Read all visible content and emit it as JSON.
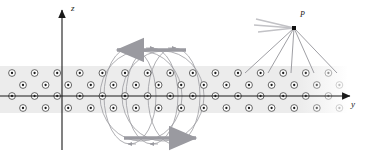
{
  "figure": {
    "background_color": "#ffffff",
    "width": 365,
    "height": 161
  },
  "axes": {
    "vertical": {
      "name": "z-axis",
      "label": "z",
      "direction": "up",
      "x": 62,
      "y_top": 10,
      "y_bottom": 150,
      "color": "#1a1a1a"
    },
    "horizontal": {
      "name": "y-axis",
      "label": "y",
      "direction": "right",
      "y": 96,
      "x_left": 0,
      "x_right": 350,
      "color": "#1a1a1a"
    }
  },
  "slab": {
    "name": "magnetized-slab",
    "fill_color": "#ececec",
    "x_start": 0,
    "x_end": 348,
    "y_top": 66,
    "y_bottom": 113,
    "row_count": 4,
    "dot_symbol": "current-out-of-page",
    "dot_ring_color": "#4a4a4a",
    "dot_center_color": "#1a1a1a",
    "rows": [
      {
        "y": 73,
        "x_start": 12,
        "spacing": 22.6,
        "count": 16
      },
      {
        "y": 85,
        "x_start": 23,
        "spacing": 22.6,
        "count": 15
      },
      {
        "y": 96,
        "x_start": 12,
        "spacing": 22.6,
        "count": 16
      },
      {
        "y": 108,
        "x_start": 23,
        "spacing": 22.6,
        "count": 15
      }
    ]
  },
  "field_loops": {
    "name": "magnetic-field-loops",
    "color": "#9a9aa0",
    "count": 5,
    "centers_x": [
      128,
      150,
      172,
      150,
      128
    ],
    "description": "Closed elliptical field lines encircling the slab",
    "ellipses": [
      {
        "cx": 130,
        "cy": 96,
        "rx": 26,
        "ry": 48
      },
      {
        "cx": 152,
        "cy": 96,
        "rx": 26,
        "ry": 48
      },
      {
        "cx": 174,
        "cy": 96,
        "rx": 26,
        "ry": 48
      },
      {
        "cx": 141,
        "cy": 96,
        "rx": 41,
        "ry": 45
      },
      {
        "cx": 163,
        "cy": 96,
        "rx": 41,
        "ry": 45
      }
    ]
  },
  "direction_arrows": [
    {
      "name": "top-field-arrow",
      "direction": "left",
      "x_tail": 186,
      "x_head": 117,
      "y": 50,
      "color": "#9a9aa0"
    },
    {
      "name": "bottom-field-arrow",
      "direction": "right",
      "x_tail": 124,
      "x_head": 196,
      "y": 138,
      "color": "#9a9aa0"
    }
  ],
  "point_P": {
    "name": "field-point-P",
    "label": "P",
    "x": 294,
    "y": 28,
    "marker_color": "#111111",
    "rays_down": {
      "color": "#8e8e94",
      "targets_x": [
        245,
        268,
        291,
        314,
        337
      ],
      "target_y": 73
    },
    "rays_upleft": {
      "color": "#c2c2c6",
      "count": 3,
      "endpoints": [
        {
          "x": 256,
          "y": 19
        },
        {
          "x": 254,
          "y": 25
        },
        {
          "x": 258,
          "y": 32
        }
      ]
    }
  }
}
